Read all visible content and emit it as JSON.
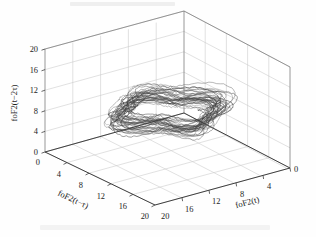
{
  "figure": {
    "kind": "3d-phase-space-plot",
    "background_color": "#fefefe",
    "curve_color": "#3b3b3b",
    "grid_color": "#c8c8c8",
    "box_edge_color": "#8a8a8a",
    "axis_line_color": "#4a4a4a",
    "text_color": "#1d1d1d"
  },
  "chart_data": {
    "type": "line",
    "title": "",
    "subtitle": "",
    "projection": "3d",
    "xlabel": "foF2(t)",
    "ylabel": "foF2(t−τ)",
    "zlabel": "foF2(t−2τ)",
    "xlim": [
      0,
      20
    ],
    "ylim": [
      0,
      20
    ],
    "zlim": [
      0,
      20
    ],
    "grid": true,
    "legend": "none",
    "x_ticks": [
      20,
      16,
      12,
      8,
      4,
      0
    ],
    "y_ticks": [
      0,
      4,
      8,
      12,
      16,
      20
    ],
    "z_ticks": [
      0,
      4,
      8,
      12,
      16,
      20
    ],
    "x_tick_labels": [
      "20",
      "16",
      "12",
      "8",
      "4",
      "0"
    ],
    "y_tick_labels": [
      "0",
      "4",
      "8",
      "12",
      "16",
      "20"
    ],
    "z_tick_labels": [
      "0",
      "4",
      "8",
      "12",
      "16",
      "20"
    ],
    "series": [
      {
        "name": "foF2 attractor trajectory",
        "color": "#3b3b3b",
        "line_width": 0.45,
        "n_orbits": 34,
        "center": [
          10.0,
          10.2,
          9.6
        ],
        "mean_radius": 5.6,
        "radius_spread": 1.5,
        "vertical_spread": 3.4
      }
    ]
  },
  "axes": {
    "z": {
      "label": "foF2(t−2τ)",
      "ticks": [
        "20",
        "16",
        "12",
        "8",
        "4",
        "0"
      ]
    },
    "y": {
      "label": "foF2(t−τ)",
      "ticks": [
        "0",
        "4",
        "8",
        "12",
        "16",
        "20"
      ]
    },
    "x": {
      "label": "foF2(t)",
      "ticks": [
        "20",
        "16",
        "12",
        "8",
        "4",
        "0"
      ]
    },
    "origin_corner_labels": [
      "0",
      "0"
    ],
    "front_corner_labels": [
      "20",
      "20"
    ]
  }
}
